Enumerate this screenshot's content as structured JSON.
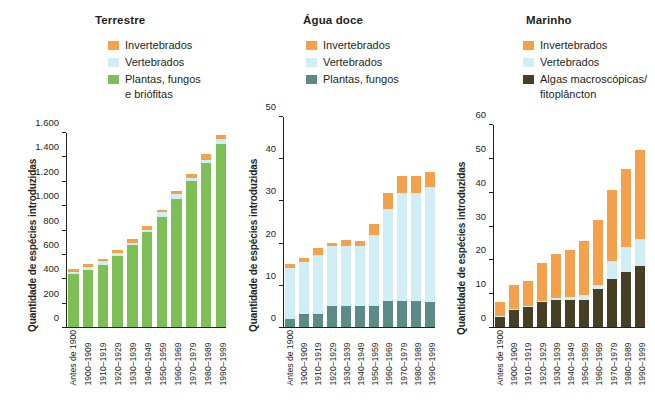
{
  "figure": {
    "background": "#ffffff",
    "text_color": "#231f20"
  },
  "colors": {
    "invertebrados": "#f5a04a",
    "vertebrados": "#cfeef5",
    "plantas_fungos_briofitas": "#7dbf56",
    "plantas_fungos": "#5b8b87",
    "algas_fitoplancton": "#463f26",
    "axis": "#231f20"
  },
  "shared": {
    "ylabel": "Quantidade de espécies introduzidas",
    "categories": [
      "Antes de 1900",
      "1900–1909",
      "1910–1919",
      "1920–1929",
      "1930–1939",
      "1940–1949",
      "1950–1959",
      "1960–1969",
      "1970–1979",
      "1980–1989",
      "1990–1999"
    ]
  },
  "panels": [
    {
      "id": "terrestre",
      "title": "Terrestre",
      "legend": [
        {
          "label": "Invertebrados",
          "cont": "",
          "color": "#f5a04a",
          "name": "invertebrados"
        },
        {
          "label": "Vertebrados",
          "cont": "",
          "color": "#cfeef5",
          "name": "vertebrados"
        },
        {
          "label": "Plantas, fungos",
          "cont": "e briófitas",
          "color": "#7dbf56",
          "name": "plantas-fungos-briofitas"
        }
      ],
      "yticks": [
        "0",
        "200",
        "400",
        "600",
        "800",
        "1.000",
        "1.200",
        "1.400",
        "1.600"
      ]
    },
    {
      "id": "aguadoce",
      "title": "Água doce",
      "legend": [
        {
          "label": "Invertebrados",
          "cont": "",
          "color": "#f5a04a",
          "name": "invertebrados"
        },
        {
          "label": "Vertebrados",
          "cont": "",
          "color": "#cfeef5",
          "name": "vertebrados"
        },
        {
          "label": "Plantas, fungos",
          "cont": "",
          "color": "#5b8b87",
          "name": "plantas-fungos"
        }
      ],
      "yticks": [
        "0",
        "10",
        "20",
        "30",
        "40",
        "50"
      ]
    },
    {
      "id": "marinho",
      "title": "Marinho",
      "legend": [
        {
          "label": "Invertebrados",
          "cont": "",
          "color": "#f5a04a",
          "name": "invertebrados"
        },
        {
          "label": "Vertebrados",
          "cont": "",
          "color": "#cfeef5",
          "name": "vertebrados"
        },
        {
          "label": "Algas macroscópicas/",
          "cont": "fitoplâncton",
          "color": "#463f26",
          "name": "algas-fitoplancton"
        }
      ],
      "yticks": [
        "0",
        "10",
        "20",
        "30",
        "40",
        "50",
        "60"
      ]
    }
  ],
  "chart_data": [
    {
      "type": "bar",
      "stacked": true,
      "title": "Terrestre",
      "xlabel": "",
      "ylabel": "Quantidade de espécies introduzidas",
      "ylim": [
        0,
        1600
      ],
      "ytick_interval": 200,
      "grid": false,
      "legend_position": "top-center",
      "categories": [
        "Antes de 1900",
        "1900–1909",
        "1910–1919",
        "1920–1929",
        "1930–1939",
        "1940–1949",
        "1950–1959",
        "1960–1969",
        "1970–1979",
        "1980–1989",
        "1990–1999"
      ],
      "series": [
        {
          "name": "Plantas, fungos e briófitas",
          "color": "#7dbf56",
          "values": [
            435,
            470,
            515,
            585,
            675,
            780,
            910,
            1055,
            1205,
            1350,
            1510
          ]
        },
        {
          "name": "Vertebrados",
          "color": "#cfeef5",
          "values": [
            20,
            22,
            32,
            24,
            22,
            22,
            38,
            40,
            28,
            30,
            40
          ]
        },
        {
          "name": "Invertebrados",
          "color": "#f5a04a",
          "values": [
            20,
            24,
            18,
            30,
            28,
            30,
            18,
            25,
            30,
            45,
            35
          ]
        }
      ],
      "totals": [
        475,
        516,
        565,
        639,
        725,
        832,
        966,
        1120,
        1263,
        1425,
        1585
      ]
    },
    {
      "type": "bar",
      "stacked": true,
      "title": "Água doce",
      "xlabel": "",
      "ylabel": "Quantidade de espécies introduzidas",
      "ylim": [
        0,
        50
      ],
      "ytick_interval": 10,
      "grid": false,
      "legend_position": "top-center",
      "categories": [
        "Antes de 1900",
        "1900–1909",
        "1910–1919",
        "1920–1929",
        "1930–1939",
        "1940–1949",
        "1950–1959",
        "1960–1969",
        "1970–1979",
        "1980–1989",
        "1990–1999"
      ],
      "series": [
        {
          "name": "Plantas, fungos",
          "color": "#5b8b87",
          "values": [
            2.0,
            3.0,
            3.2,
            5.0,
            5.0,
            5.0,
            4.9,
            6.1,
            6.1,
            6.1,
            5.9
          ]
        },
        {
          "name": "Vertebrados",
          "color": "#cfeef5",
          "values": [
            12.0,
            12.4,
            14.0,
            14.3,
            14.4,
            14.4,
            17.0,
            21.9,
            25.9,
            25.9,
            27.4
          ]
        },
        {
          "name": "Invertebrados",
          "color": "#f5a04a",
          "values": [
            0.9,
            1.1,
            1.6,
            0.8,
            1.3,
            1.1,
            2.6,
            4.0,
            4.0,
            4.0,
            3.7
          ]
        }
      ],
      "totals": [
        14.9,
        16.5,
        18.8,
        20.1,
        20.7,
        20.5,
        24.5,
        32.0,
        36.0,
        36.0,
        37.0
      ]
    },
    {
      "type": "bar",
      "stacked": true,
      "title": "Marinho",
      "xlabel": "",
      "ylabel": "Quantidade de espécies introduzidas",
      "ylim": [
        0,
        60
      ],
      "ytick_interval": 10,
      "grid": false,
      "legend_position": "top-center",
      "categories": [
        "Antes de 1900",
        "1900–1909",
        "1910–1919",
        "1920–1929",
        "1930–1939",
        "1940–1949",
        "1950–1959",
        "1960–1969",
        "1970–1979",
        "1980–1989",
        "1990–1999"
      ],
      "series": [
        {
          "name": "Algas macroscópicas/fitoplâncton",
          "color": "#463f26",
          "values": [
            3.1,
            5.2,
            6.0,
            7.4,
            7.9,
            7.9,
            7.9,
            11.2,
            14.4,
            16.2,
            18.1
          ]
        },
        {
          "name": "Vertebrados",
          "color": "#cfeef5",
          "values": [
            0.3,
            0.3,
            0.3,
            0.3,
            0.8,
            0.9,
            1.6,
            1.3,
            5.2,
            7.6,
            8.0
          ]
        },
        {
          "name": "Invertebrados",
          "color": "#f5a04a",
          "values": [
            4.1,
            7.1,
            7.5,
            11.2,
            13.1,
            14.1,
            16.2,
            19.2,
            21.1,
            23.0,
            26.4
          ]
        }
      ],
      "totals": [
        7.5,
        12.6,
        13.8,
        18.9,
        21.8,
        22.9,
        25.7,
        31.7,
        40.7,
        46.8,
        52.5
      ]
    }
  ]
}
